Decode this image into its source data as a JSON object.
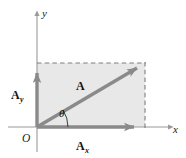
{
  "figure": {
    "background_color": "#ffffff",
    "width": 186,
    "height": 158
  },
  "colors": {
    "axis": "#8c8c8c",
    "vector": "#8a8a8a",
    "vector_dark": "#7d7d7d",
    "shade_fill": "#e8e8e8",
    "dashed": "#8a8a8a",
    "text": "#1a1a1a"
  },
  "axes": {
    "x_label": "x",
    "y_label": "y",
    "origin_label": "O",
    "x_axis_y_px": 127,
    "y_axis_x_px": 37
  },
  "vectors": [
    {
      "id": "resultant",
      "label": "A",
      "subscript": "",
      "from": [
        37,
        127
      ],
      "to": [
        145,
        63
      ],
      "label_pos": [
        79,
        88
      ]
    },
    {
      "id": "x-component",
      "label": "A",
      "subscript": "x",
      "from": [
        37,
        127
      ],
      "to": [
        145,
        127
      ],
      "label_pos": [
        82,
        147
      ]
    },
    {
      "id": "y-component",
      "label": "A",
      "subscript": "y",
      "from": [
        37,
        127
      ],
      "to": [
        37,
        63
      ],
      "label_pos": [
        16,
        96
      ]
    }
  ],
  "angle": {
    "symbol": "θ",
    "label_pos": [
      62,
      112
    ],
    "vertex": [
      37,
      127
    ]
  },
  "shaded_rect": {
    "x": 37,
    "y": 63,
    "width": 108,
    "height": 64
  },
  "dashed_lines": [
    {
      "id": "top-edge",
      "from": [
        37,
        63
      ],
      "to": [
        145,
        63
      ]
    },
    {
      "id": "right-edge",
      "from": [
        145,
        63
      ],
      "to": [
        145,
        127
      ]
    }
  ]
}
